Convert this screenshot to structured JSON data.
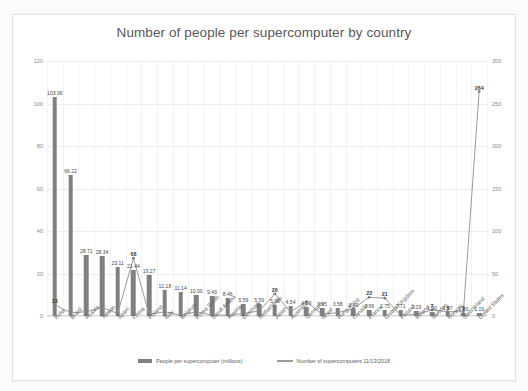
{
  "chart_data": {
    "type": "bar",
    "title": "Number of people per supercomputer by country",
    "xlabel": "",
    "ylabel": "",
    "ylim": [
      0,
      120
    ],
    "y2lim": [
      0,
      300
    ],
    "grid": true,
    "legend_position": "bottom",
    "categories": [
      "India",
      "Brazil",
      "Russia",
      "Taiwan",
      "Spain",
      "China",
      "Poland",
      "Italy",
      "Belgium",
      "Korea South",
      "Saudi Arabia",
      "Austria",
      "Denmark",
      "Netherlands",
      "Japan",
      "Australia",
      "Germany",
      "Israel",
      "Hong Kong",
      "Canada",
      "France",
      "United Kingdom",
      "Finland",
      "Ireland",
      "Sweden",
      "Norway",
      "Switzerland",
      "United States"
    ],
    "series": [
      {
        "name": "People per supercomputer (millions)",
        "axis": "left",
        "color": "#808080",
        "values": [
          103.06,
          66.22,
          28.71,
          28.34,
          23.11,
          21.44,
          19.27,
          12.18,
          11.14,
          10.0,
          9.43,
          8.46,
          5.59,
          5.59,
          5.36,
          4.54,
          4.09,
          3.95,
          3.58,
          3.49,
          2.99,
          2.75,
          2.71,
          2.29,
          1.9,
          1.87,
          1.6,
          1.19
        ],
        "labels": [
          "103.06",
          "66.22",
          "28.71",
          "28.34",
          "23.11",
          "21.44",
          "19.27",
          "12.18",
          "11.14",
          "10.00",
          "9.43",
          "8.46",
          "5.59",
          "5.59",
          "5.36",
          "4.54",
          "4.09",
          "3.95",
          "3.58",
          "3.49",
          "2.99",
          "2.75",
          "2.71",
          "2.29",
          "1.90",
          "1.87",
          "1.60",
          "1.19"
        ]
      },
      {
        "name": "Number of supercomputers 11/13/2018",
        "axis": "right",
        "color": "#9a9a9a",
        "values": [
          13,
          4,
          5,
          10,
          3,
          68,
          2,
          5,
          1,
          5,
          1,
          1,
          3,
          6,
          26,
          5,
          17,
          2,
          4,
          9,
          22,
          21,
          1,
          2,
          7,
          5,
          5,
          264
        ],
        "labels": [
          "13",
          "4",
          "5",
          "10",
          "3",
          "68",
          "2",
          "5",
          "1",
          "5",
          "1",
          "1",
          "3",
          "6",
          "26",
          "5",
          "17",
          "2",
          "4",
          "9",
          "22",
          "21",
          "1",
          "2",
          "7",
          "5",
          "5",
          "264"
        ],
        "visible_labels": {
          "0": "13",
          "5": "68",
          "14": "26",
          "20": "22",
          "21": "21",
          "24": "7",
          "25": "5",
          "26": "5",
          "27": "264"
        }
      }
    ],
    "y_ticks_left": [
      "0",
      "20",
      "40",
      "60",
      "80",
      "100",
      "120"
    ],
    "y_ticks_right": [
      "0",
      "50",
      "100",
      "150",
      "200",
      "250",
      "300"
    ]
  },
  "legend": {
    "bars_label": "People per supercomputer (millions)",
    "line_label": "Number of supercomputers 11/13/2018"
  }
}
